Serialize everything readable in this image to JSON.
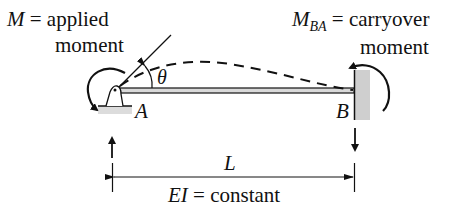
{
  "labels": {
    "applied_symbol": "M",
    "applied_text": "= applied",
    "applied_text2": "moment",
    "carryover_symbol": "M",
    "carryover_sub": "BA",
    "carryover_text": "= carryover",
    "carryover_text2": "moment",
    "theta": "θ",
    "point_a": "A",
    "point_b": "B",
    "length": "L",
    "ei_symbol": "EI",
    "ei_text": "= constant"
  },
  "colors": {
    "ink": "#111111",
    "beam_fill": "#d9d9d9",
    "wall_fill": "#cfcfcf",
    "background": "#ffffff"
  }
}
